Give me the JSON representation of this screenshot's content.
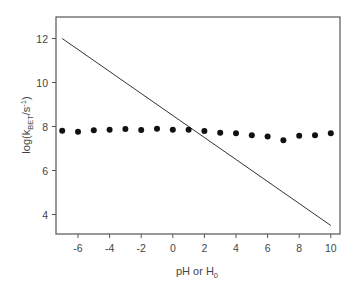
{
  "chart_data": {
    "type": "scatter",
    "title": "",
    "xlabel": "pH or H0",
    "xlabel_parts": {
      "main": "pH or H",
      "sub": "0"
    },
    "ylabel": "log(kBET/s-1)",
    "ylabel_parts": {
      "prefix": "log(k",
      "sub": "BET",
      "mid": "/s",
      "sup": "-1",
      "suffix": ")"
    },
    "xlim": [
      -7.5,
      10.5
    ],
    "ylim": [
      3,
      13
    ],
    "x_ticks": [
      -6,
      -4,
      -2,
      0,
      2,
      4,
      6,
      8,
      10
    ],
    "x_tick_labels": [
      "-6",
      "-4",
      "-2",
      "0",
      "2",
      "4",
      "6",
      "8",
      "10"
    ],
    "y_ticks": [
      4,
      6,
      8,
      10,
      12
    ],
    "y_tick_labels": [
      "4",
      "6",
      "8",
      "10",
      "12"
    ],
    "grid": false,
    "legend": null,
    "series": [
      {
        "name": "data points",
        "type": "scatter",
        "marker": "filled-circle",
        "color": "#111111",
        "x": [
          -7,
          -6,
          -5,
          -4,
          -3,
          -2,
          -1,
          0,
          1,
          2,
          3,
          4,
          5,
          6,
          7,
          8,
          9,
          10
        ],
        "y": [
          7.81,
          7.76,
          7.83,
          7.85,
          7.89,
          7.84,
          7.9,
          7.85,
          7.85,
          7.8,
          7.72,
          7.69,
          7.6,
          7.54,
          7.37,
          7.58,
          7.6,
          7.69
        ]
      },
      {
        "name": "line",
        "type": "line",
        "color": "#333333",
        "x": [
          -7,
          10
        ],
        "y": [
          12.0,
          3.5
        ]
      }
    ]
  },
  "plot_layout": {
    "frame": {
      "left": 56,
      "top": 17,
      "right": 340,
      "bottom": 234
    },
    "x_px": {
      "v0": -6,
      "px0": 78,
      "px_per_unit": 15.8
    },
    "y_px": {
      "v0": 8,
      "px0": 126.5,
      "px_per_unit": 22
    }
  }
}
